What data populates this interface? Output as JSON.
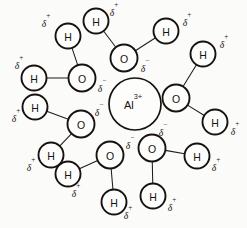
{
  "diagram": {
    "ion": {
      "symbol": "Al",
      "charge": "3+",
      "label": "Al3+",
      "cx": 135,
      "cy": 104,
      "r": 26
    },
    "atom_labels": {
      "oxygen": "O",
      "hydrogen": "H"
    },
    "charge_symbols": {
      "delta_negative_base": "δ",
      "delta_negative_sign": "−",
      "delta_positive_base": "δ",
      "delta_positive_sign": "+"
    },
    "colors": {
      "background": "#fbfbfa",
      "outline": "#17120f",
      "bond": "#201c1a",
      "text": "#17120f"
    },
    "atom_radii": {
      "oxygen": 13.5,
      "hydrogen": 12.5
    },
    "water_molecules": [
      {
        "name": "water-top-left",
        "oxygen": {
          "cx": 82,
          "cy": 78,
          "label": "O"
        },
        "oxygen_charge": {
          "x": 102,
          "y": 88,
          "type": "negative"
        },
        "hydrogens": [
          {
            "cx": 68,
            "cy": 36,
            "label": "H",
            "charge_x": 46,
            "charge_y": 23
          },
          {
            "cx": 34,
            "cy": 78,
            "label": "H",
            "charge_x": 19,
            "charge_y": 65
          }
        ]
      },
      {
        "name": "water-top-center",
        "oxygen": {
          "cx": 124,
          "cy": 58,
          "label": "O"
        },
        "oxygen_charge": {
          "x": 145,
          "y": 68,
          "type": "negative"
        },
        "hydrogens": [
          {
            "cx": 96,
            "cy": 21,
            "label": "H",
            "charge_x": 114,
            "charge_y": 12
          },
          {
            "cx": 166,
            "cy": 31,
            "label": "H",
            "charge_x": 187,
            "charge_y": 22
          }
        ]
      },
      {
        "name": "water-right",
        "oxygen": {
          "cx": 176,
          "cy": 98,
          "label": "O"
        },
        "oxygen_charge": {
          "x": 156,
          "y": 107,
          "type": "negative"
        },
        "hydrogens": [
          {
            "cx": 203,
            "cy": 54,
            "label": "H",
            "charge_x": 224,
            "charge_y": 44
          },
          {
            "cx": 215,
            "cy": 122,
            "label": "H",
            "charge_x": 235,
            "charge_y": 131
          }
        ]
      },
      {
        "name": "water-left",
        "oxygen": {
          "cx": 81,
          "cy": 124,
          "label": "O"
        },
        "oxygen_charge": {
          "x": 99,
          "y": 112,
          "type": "negative"
        },
        "hydrogens": [
          {
            "cx": 35,
            "cy": 107,
            "label": "H",
            "charge_x": 16,
            "charge_y": 118
          },
          {
            "cx": 51,
            "cy": 155,
            "label": "H",
            "charge_x": 31,
            "charge_y": 167
          }
        ]
      },
      {
        "name": "water-bottom-center",
        "oxygen": {
          "cx": 110,
          "cy": 155,
          "label": "O"
        },
        "oxygen_charge": {
          "x": 130,
          "y": 145,
          "type": "negative"
        },
        "hydrogens": [
          {
            "cx": 68,
            "cy": 174,
            "label": "H",
            "charge_x": 76,
            "charge_y": 193
          },
          {
            "cx": 114,
            "cy": 202,
            "label": "H",
            "charge_x": 128,
            "charge_y": 215
          }
        ]
      },
      {
        "name": "water-bottom-right",
        "oxygen": {
          "cx": 152,
          "cy": 148,
          "label": "O"
        },
        "oxygen_charge": {
          "x": 163,
          "y": 132,
          "type": "negative"
        },
        "hydrogens": [
          {
            "cx": 197,
            "cy": 156,
            "label": "H",
            "charge_x": 216,
            "charge_y": 167
          },
          {
            "cx": 153,
            "cy": 196,
            "label": "H",
            "charge_x": 172,
            "charge_y": 207
          }
        ]
      }
    ],
    "ion_adjacent_charges": [
      {
        "x": 102,
        "y": 88,
        "type": "negative"
      },
      {
        "x": 99,
        "y": 112,
        "type": "negative"
      },
      {
        "x": 156,
        "y": 107,
        "type": "negative"
      },
      {
        "x": 145,
        "y": 68,
        "type": "negative"
      }
    ]
  }
}
